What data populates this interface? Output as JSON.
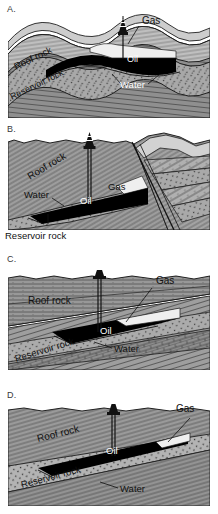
{
  "figure": {
    "panels": [
      {
        "id": "a",
        "letter": "A.",
        "trap_type": "anticline trap",
        "labels": {
          "roof_rock": "Roof rock",
          "reservoir_rock": "Reservoir rock",
          "gas": "Gas",
          "oil": "Oil",
          "water": "Water"
        },
        "features": [
          "drilling-derrick",
          "borehole",
          "gas-cap",
          "oil-pool",
          "water-leg"
        ]
      },
      {
        "id": "b",
        "letter": "B.",
        "trap_type": "fault trap",
        "labels": {
          "roof_rock": "Roof rock",
          "reservoir_rock": "Reservoir rock",
          "gas": "Gas",
          "oil": "Oil",
          "water": "Water"
        },
        "features": [
          "drilling-derrick",
          "borehole",
          "fault-plane",
          "gas-cap",
          "oil-pool",
          "water-leg"
        ]
      },
      {
        "id": "c",
        "letter": "C.",
        "trap_type": "unconformity trap",
        "labels": {
          "roof_rock": "Roof rock",
          "reservoir_rock": "Reservoir rock",
          "gas": "Gas",
          "oil": "Oil",
          "water": "Water"
        },
        "features": [
          "drilling-derrick",
          "borehole",
          "gas-cap",
          "oil-pool",
          "water-leg"
        ]
      },
      {
        "id": "d",
        "letter": "D.",
        "trap_type": "stratigraphic pinch-out trap",
        "labels": {
          "roof_rock": "Roof rock",
          "reservoir_rock": "Reservoir rock",
          "gas": "Gas",
          "oil": "Oil",
          "water": "Water"
        },
        "features": [
          "drilling-derrick",
          "borehole",
          "gas-cap",
          "oil-pool",
          "water-leg"
        ]
      }
    ],
    "colors": {
      "oil": "#000000",
      "gas": "#e8e8e8",
      "roof_rock": "#8d8d8d",
      "reservoir_rock": "#9a9a9a",
      "cap_light": "#c9c9c9",
      "outline": "#1a1a1a",
      "background": "#ffffff"
    }
  }
}
